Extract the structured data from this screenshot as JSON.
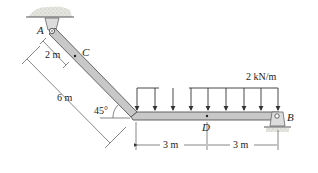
{
  "diagram": {
    "type": "structural-beam",
    "points": {
      "A": {
        "label": "A",
        "support": "pin (ceiling)"
      },
      "B": {
        "label": "B",
        "support": "roller"
      },
      "C": {
        "label": "C"
      },
      "D": {
        "label": "D"
      }
    },
    "load": {
      "label": "2 kN/m",
      "type": "uniform distributed"
    },
    "dimensions": {
      "ac": "2 m",
      "inclined_length": "6 m",
      "angle": "45°",
      "left_span": "3 m",
      "right_span": "3 m"
    },
    "colors": {
      "beam_fill": "#c8c8c8",
      "beam_edge": "#555555",
      "line": "#333333",
      "ground": "#d8d8d0"
    }
  }
}
